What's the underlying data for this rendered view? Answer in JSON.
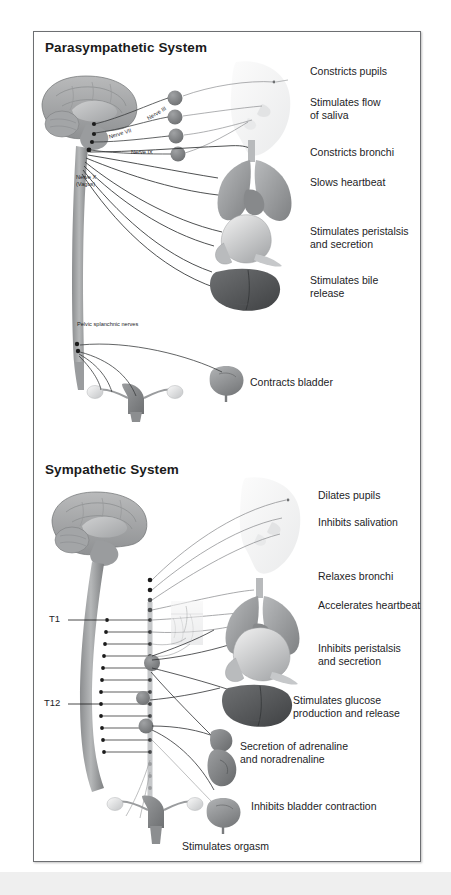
{
  "figure": {
    "title_parasympathetic": "Parasympathetic System",
    "title_sympathetic": "Sympathetic System",
    "frame_color": "#6d6f72",
    "text_color": "#1d1d1f",
    "background": "#ffffff"
  },
  "parasympathetic": {
    "nerve_labels": [
      {
        "text": "Nerve III"
      },
      {
        "text": "Nerve VII"
      },
      {
        "text": "Nerve IX"
      },
      {
        "text": "Nerve X\n(Vagus)"
      },
      {
        "text": "Pelvic splanchnic nerves"
      }
    ],
    "effects": [
      {
        "text": "Constricts pupils"
      },
      {
        "text": "Stimulates flow\nof saliva"
      },
      {
        "text": "Constricts bronchi"
      },
      {
        "text": "Slows heartbeat"
      },
      {
        "text": "Stimulates peristalsis\nand secretion"
      },
      {
        "text": "Stimulates bile\nrelease"
      },
      {
        "text": "Contracts bladder"
      }
    ],
    "organs": [
      {
        "name": "brain"
      },
      {
        "name": "head-profile"
      },
      {
        "name": "lungs-heart"
      },
      {
        "name": "stomach-pancreas"
      },
      {
        "name": "liver"
      },
      {
        "name": "bladder"
      },
      {
        "name": "uterus-ovaries"
      }
    ],
    "ganglia_count": 4
  },
  "sympathetic": {
    "spinal_labels": [
      {
        "text": "T1"
      },
      {
        "text": "T12"
      }
    ],
    "effects": [
      {
        "text": "Dilates pupils"
      },
      {
        "text": "Inhibits salivation"
      },
      {
        "text": "Relaxes bronchi"
      },
      {
        "text": "Accelerates heartbeat"
      },
      {
        "text": "Inhibits peristalsis\nand secretion"
      },
      {
        "text": "Stimulates glucose\nproduction and release"
      },
      {
        "text": "Secretion of adrenaline\nand noradrenaline"
      },
      {
        "text": "Inhibits bladder contraction"
      },
      {
        "text": "Stimulates orgasm"
      }
    ],
    "organs": [
      {
        "name": "brain"
      },
      {
        "name": "head-profile"
      },
      {
        "name": "lungs-heart"
      },
      {
        "name": "skin-hair-follicle"
      },
      {
        "name": "stomach-pancreas"
      },
      {
        "name": "liver"
      },
      {
        "name": "adrenal-kidney"
      },
      {
        "name": "bladder"
      },
      {
        "name": "uterus-ovaries"
      }
    ],
    "ganglia_count": 3
  }
}
